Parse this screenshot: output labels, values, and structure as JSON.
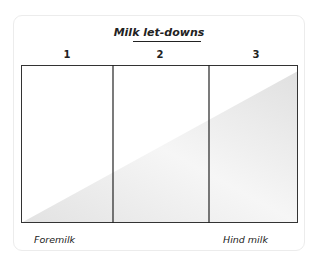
{
  "title": "Milk let-downs",
  "columns": [
    {
      "label": "1"
    },
    {
      "label": "2"
    },
    {
      "label": "3"
    }
  ],
  "labels": {
    "left": "Foremilk",
    "right": "Hind milk"
  },
  "colors": {
    "border": "#333333",
    "shading": "#e8e8e8",
    "card_border": "#ececec",
    "text": "#222222"
  }
}
